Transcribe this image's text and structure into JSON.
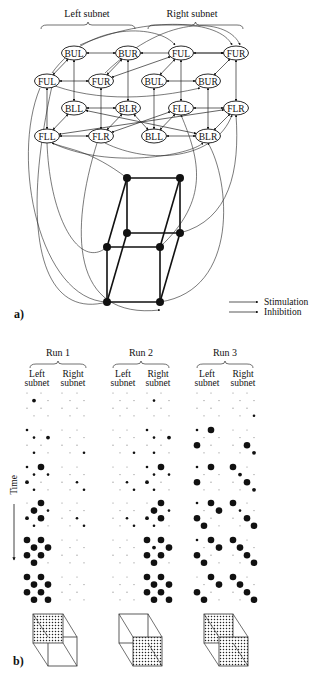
{
  "panel_a": {
    "label": "a)",
    "headers": [
      {
        "text": "Left subnet",
        "x": 87,
        "y": 17,
        "brace": [
          41,
          135
        ]
      },
      {
        "text": "Right subnet",
        "x": 192,
        "y": 17,
        "brace": [
          148,
          243
        ]
      }
    ],
    "nodes": [
      {
        "id": "L_BUL",
        "text": "BUL",
        "x": 74,
        "y": 53
      },
      {
        "id": "L_BUR",
        "text": "BUR",
        "x": 128,
        "y": 53
      },
      {
        "id": "R_FUL",
        "text": "FUL",
        "x": 181,
        "y": 53
      },
      {
        "id": "R_FUR",
        "text": "FUR",
        "x": 236,
        "y": 53
      },
      {
        "id": "L_FUL",
        "text": "FUL",
        "x": 47,
        "y": 81
      },
      {
        "id": "L_FUR",
        "text": "FUR",
        "x": 101,
        "y": 81
      },
      {
        "id": "R_BUL",
        "text": "BUL",
        "x": 154,
        "y": 81
      },
      {
        "id": "R_BUR",
        "text": "BUR",
        "x": 208,
        "y": 81
      },
      {
        "id": "L_BLL",
        "text": "BLL",
        "x": 74,
        "y": 108
      },
      {
        "id": "L_BLR",
        "text": "BLR",
        "x": 128,
        "y": 108
      },
      {
        "id": "R_FLL",
        "text": "FLL",
        "x": 181,
        "y": 108
      },
      {
        "id": "R_FLR",
        "text": "FLR",
        "x": 236,
        "y": 108
      },
      {
        "id": "L_FLL",
        "text": "FLL",
        "x": 47,
        "y": 136
      },
      {
        "id": "L_FLR",
        "text": "FLR",
        "x": 101,
        "y": 136
      },
      {
        "id": "R_BLL",
        "text": "BLL",
        "x": 154,
        "y": 136
      },
      {
        "id": "R_BLR",
        "text": "BLR",
        "x": 208,
        "y": 136
      }
    ],
    "edges": [
      [
        "L_BUL",
        "L_BUR"
      ],
      [
        "R_FUL",
        "R_FUR"
      ],
      [
        "L_FUL",
        "L_FUR"
      ],
      [
        "R_BUL",
        "R_BUR"
      ],
      [
        "L_BLL",
        "L_BLR"
      ],
      [
        "R_FLL",
        "R_FLR"
      ],
      [
        "L_FLL",
        "L_FLR"
      ],
      [
        "R_BLL",
        "R_BLR"
      ],
      [
        "L_BUL",
        "L_FUL"
      ],
      [
        "L_BUR",
        "L_FUR"
      ],
      [
        "R_FUL",
        "R_BUL"
      ],
      [
        "R_FUR",
        "R_BUR"
      ],
      [
        "L_BLL",
        "L_FLL"
      ],
      [
        "L_BLR",
        "L_FLR"
      ],
      [
        "R_FLL",
        "R_BLL"
      ],
      [
        "R_FLR",
        "R_BLR"
      ],
      [
        "L_BUL",
        "L_BLL"
      ],
      [
        "L_BUR",
        "L_BLR"
      ],
      [
        "R_FUL",
        "R_FLL"
      ],
      [
        "R_FUR",
        "R_FLR"
      ],
      [
        "L_FUL",
        "L_FLL"
      ],
      [
        "L_FUR",
        "L_FLR"
      ],
      [
        "R_BUL",
        "R_BLL"
      ],
      [
        "R_BUR",
        "R_BLR"
      ],
      [
        "L_FUR",
        "R_FUL"
      ],
      [
        "L_BUR",
        "R_FUR"
      ],
      [
        "L_BLR",
        "R_BLL"
      ],
      [
        "L_BLL",
        "R_BLR"
      ],
      [
        "L_FLR",
        "R_FLL"
      ],
      [
        "L_FLL",
        "R_FLR"
      ]
    ],
    "curves": [
      "M 52 73 C 90 20, 160 25, 175 45",
      "M 80 45 C 150 15, 220 20, 232 45",
      "M 105 73 C 170 10, 230 20, 240 45",
      "M 55 86 C 110 105, 170 95, 200 88",
      "M 52 143 C 110 170, 190 155, 203 143",
      "M 105 143 C 150 165, 215 160, 232 115",
      "M 40 88 C 10 160, 40 300, 107 302",
      "M 47 143 C 50 220, 80 270, 107 247",
      "M 97 143 C 70 230, 70 320, 160 310",
      "M 160 302 C 240 290, 230 180, 208 143",
      "M 180 233 C 230 220, 240 170, 236 115",
      "M 107 302 C 40 320, 20 230, 52 86",
      "M 160 247 C 210 200, 200 160, 181 115",
      "M 127 178 C 90 150, 70 150, 52 143"
    ],
    "cube": {
      "back": [
        [
          127,
          178
        ],
        [
          180,
          178
        ],
        [
          180,
          233
        ],
        [
          127,
          233
        ]
      ],
      "front": [
        [
          107,
          247
        ],
        [
          160,
          247
        ],
        [
          160,
          302
        ],
        [
          107,
          302
        ]
      ]
    },
    "legend": [
      {
        "text": "Stimulation",
        "x1": 229,
        "x2": 258,
        "y": 305
      },
      {
        "text": "Inhibition",
        "x1": 229,
        "x2": 258,
        "y": 315
      }
    ]
  },
  "panel_b": {
    "label": "b)",
    "time_label": "Time",
    "runs": [
      {
        "title": "Run 1",
        "title_x": 58,
        "left_x": 37,
        "right_x": 73,
        "left_cols": [
          27,
          34,
          41,
          48
        ],
        "right_cols": [
          62,
          70,
          77,
          84
        ],
        "left_steps": [
          [
            0,
            0,
            2,
            0,
            0,
            0,
            0,
            0
          ],
          [
            1,
            0,
            1,
            2,
            0,
            0,
            1,
            0
          ],
          [
            1,
            3,
            1,
            1,
            2,
            0,
            1,
            0
          ],
          [
            0,
            3,
            3,
            1,
            2,
            3,
            1,
            0
          ],
          [
            3,
            3,
            3,
            3,
            3,
            3,
            3,
            0
          ],
          [
            3,
            3,
            3,
            3,
            3,
            3,
            3,
            3
          ]
        ],
        "right_steps": [
          [
            0,
            0,
            0,
            0,
            0,
            0,
            0,
            0
          ],
          [
            0,
            0,
            0,
            0,
            0,
            0,
            0,
            1
          ],
          [
            0,
            0,
            0,
            0,
            0,
            1,
            0,
            1
          ],
          [
            0,
            0,
            0,
            0,
            0,
            1,
            0,
            1
          ],
          [
            0,
            0,
            0,
            0,
            0,
            0,
            0,
            0
          ],
          [
            0,
            0,
            0,
            0,
            0,
            0,
            0,
            0
          ]
        ],
        "cube": {
          "back": [
            33,
            614,
            30,
            29
          ],
          "front": [
            48,
            637,
            29,
            29
          ],
          "fill_back": true,
          "fill_front": false
        }
      },
      {
        "title": "Run 2",
        "title_x": 141,
        "left_x": 123,
        "right_x": 158,
        "left_cols": [
          113,
          120,
          127,
          134
        ],
        "right_cols": [
          147,
          154,
          161,
          169
        ],
        "left_steps": [
          [
            0,
            0,
            0,
            0,
            0,
            0,
            0,
            0
          ],
          [
            0,
            0,
            0,
            0,
            0,
            0,
            0,
            1
          ],
          [
            0,
            0,
            0,
            0,
            0,
            1,
            0,
            1
          ],
          [
            0,
            0,
            0,
            0,
            0,
            1,
            0,
            1
          ],
          [
            0,
            0,
            0,
            0,
            0,
            0,
            0,
            0
          ],
          [
            0,
            0,
            0,
            0,
            0,
            0,
            0,
            0
          ]
        ],
        "right_steps": [
          [
            0,
            0,
            1,
            0,
            0,
            0,
            0,
            0
          ],
          [
            1,
            0,
            1,
            2,
            0,
            0,
            1,
            0
          ],
          [
            1,
            3,
            1,
            1,
            2,
            0,
            1,
            0
          ],
          [
            0,
            3,
            3,
            1,
            2,
            3,
            1,
            0
          ],
          [
            3,
            3,
            2,
            3,
            3,
            3,
            3,
            0
          ],
          [
            3,
            3,
            3,
            3,
            3,
            3,
            3,
            3
          ]
        ],
        "cube": {
          "back": [
            119,
            614,
            29,
            29
          ],
          "front": [
            133,
            637,
            29,
            29
          ],
          "fill_back": false,
          "fill_front": true
        }
      },
      {
        "title": "Run 3",
        "title_x": 225,
        "left_x": 207,
        "right_x": 243,
        "left_cols": [
          197,
          204,
          211,
          219
        ],
        "right_cols": [
          233,
          240,
          247,
          254
        ],
        "left_steps": [
          [
            0,
            0,
            0,
            0,
            0,
            0,
            0,
            0
          ],
          [
            1,
            3,
            0,
            0,
            3,
            0,
            0,
            0
          ],
          [
            1,
            3,
            0,
            0,
            3,
            0,
            0,
            0
          ],
          [
            1,
            3,
            0,
            3,
            3,
            0,
            3,
            0
          ],
          [
            1,
            3,
            0,
            3,
            3,
            0,
            3,
            0
          ],
          [
            0,
            3,
            0,
            3,
            3,
            0,
            3,
            0
          ]
        ],
        "right_steps": [
          [
            0,
            0,
            0,
            0,
            0,
            0,
            0,
            1
          ],
          [
            0,
            0,
            0,
            0,
            0,
            3,
            0,
            2
          ],
          [
            3,
            0,
            2,
            0,
            0,
            3,
            0,
            2
          ],
          [
            3,
            0,
            1,
            0,
            0,
            3,
            0,
            3
          ],
          [
            3,
            0,
            3,
            0,
            0,
            3,
            0,
            3
          ],
          [
            3,
            0,
            3,
            0,
            0,
            3,
            0,
            3
          ]
        ],
        "cube": {
          "back": [
            204,
            614,
            29,
            29
          ],
          "front": [
            219,
            637,
            29,
            29
          ],
          "fill_back": true,
          "fill_front": true
        }
      }
    ],
    "subnet_labels": {
      "left": [
        "Left",
        "subnet"
      ],
      "right": [
        "Right",
        "subnet"
      ]
    },
    "step_y": [
      393,
      430,
      467,
      503,
      540,
      577
    ],
    "row_gap": 7.6,
    "dot_radius": [
      0.6,
      1.3,
      1.9,
      3.3
    ]
  }
}
